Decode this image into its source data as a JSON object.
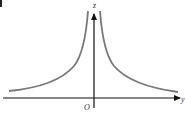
{
  "diagram": {
    "type": "function-graph",
    "axes": {
      "horizontal_label": "y",
      "vertical_label": "z",
      "origin_label": "O"
    },
    "curve": {
      "description": "two branches symmetric about the z-axis, rising steeply toward the z-axis and decaying toward the y-axis",
      "color": "#777777"
    },
    "axis_color": "#111111"
  }
}
